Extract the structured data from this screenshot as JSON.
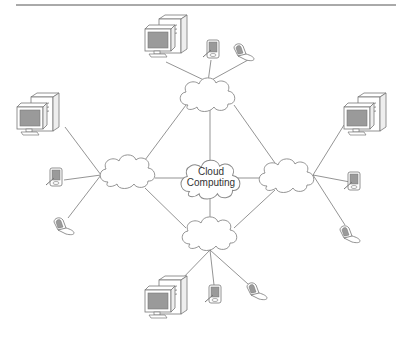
{
  "diagram": {
    "title": "Cloud Computing",
    "center_label_line1": "Cloud",
    "center_label_line2": "Computing",
    "colors": {
      "line": "#555555",
      "cloud_stroke": "#888888",
      "screen_fill": "#9a9a9a",
      "device_stroke": "#777777",
      "top_rule": "#555555"
    },
    "clouds": [
      {
        "id": "center",
        "label": "Cloud Computing"
      },
      {
        "id": "top"
      },
      {
        "id": "left"
      },
      {
        "id": "right"
      },
      {
        "id": "bottom"
      }
    ],
    "clusters": [
      {
        "position": "top",
        "devices": [
          "desktop-computer",
          "pda",
          "flip-phone"
        ]
      },
      {
        "position": "left",
        "devices": [
          "desktop-computer",
          "pda",
          "flip-phone"
        ]
      },
      {
        "position": "right",
        "devices": [
          "desktop-computer",
          "pda",
          "flip-phone"
        ]
      },
      {
        "position": "bottom",
        "devices": [
          "desktop-computer",
          "pda",
          "flip-phone"
        ]
      }
    ]
  }
}
